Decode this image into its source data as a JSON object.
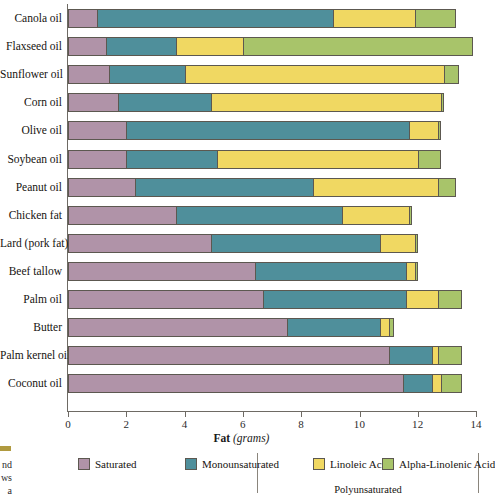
{
  "chart_data": {
    "type": "bar",
    "orientation": "horizontal",
    "stacked": true,
    "title": "",
    "xlabel_bold": "Fat",
    "xlabel_italic": "(grams)",
    "ylabel": "",
    "xlim": [
      0,
      14
    ],
    "xticks": [
      0,
      2,
      4,
      6,
      8,
      10,
      12,
      14
    ],
    "xtick_labels": [
      "0",
      "2",
      "4",
      "6",
      "8",
      "10",
      "12",
      "14"
    ],
    "grid": false,
    "legend_position": "bottom",
    "categories": [
      "Canola oil",
      "Flaxseed oil",
      "Sunflower oil",
      "Corn oil",
      "Olive oil",
      "Soybean oil",
      "Peanut oil",
      "Chicken fat",
      "Lard (pork fat)",
      "Beef tallow",
      "Palm oil",
      "Butter",
      "Palm kernel oil",
      "Coconut oil"
    ],
    "series": [
      {
        "name": "Saturated",
        "color": "#b093a8",
        "values": [
          1.0,
          1.3,
          1.4,
          1.7,
          2.0,
          2.0,
          2.3,
          3.7,
          4.9,
          6.4,
          6.7,
          7.5,
          11.0,
          11.5
        ]
      },
      {
        "name": "Monounsaturated",
        "color": "#4f8f9b",
        "values": [
          8.1,
          2.4,
          2.6,
          3.2,
          9.7,
          3.1,
          6.1,
          5.7,
          5.8,
          5.2,
          4.9,
          3.2,
          1.5,
          1.0
        ]
      },
      {
        "name": "Linoleic Acid",
        "color": "#f0d862",
        "values": [
          2.8,
          2.3,
          8.9,
          7.9,
          1.0,
          6.9,
          4.3,
          2.3,
          1.2,
          0.3,
          1.1,
          0.3,
          0.2,
          0.3
        ]
      },
      {
        "name": "Alpha-Linolenic Acid",
        "color": "#a8c46a",
        "values": [
          1.4,
          7.9,
          0.5,
          0.1,
          0.1,
          0.8,
          0.6,
          0.1,
          0.1,
          0.1,
          0.8,
          0.2,
          0.8,
          0.7
        ]
      }
    ],
    "totals": [
      13.3,
      13.9,
      13.4,
      12.9,
      12.8,
      12.8,
      13.3,
      11.8,
      12.0,
      12.0,
      13.5,
      11.2,
      13.5,
      13.5
    ],
    "legend_group": {
      "label": "Polyunsaturated",
      "members": [
        "Linoleic Acid",
        "Alpha-Linolenic Acid"
      ]
    }
  },
  "margin_note": "nd\nws\na",
  "margin_note_lines": [
    "nd",
    "ws",
    "a"
  ]
}
